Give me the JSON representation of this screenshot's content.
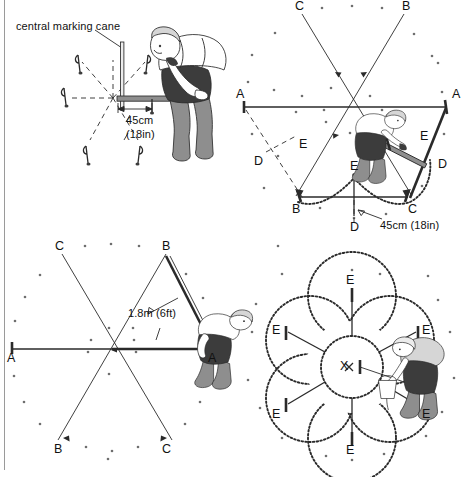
{
  "document": {
    "title": "Marking out a six-bed circular (hexagonal) garden plot",
    "panel_count": 4
  },
  "panels": [
    {
      "id": "panel-1",
      "position": "top-left",
      "name": "setting-the-central-cane",
      "caption": "central marking cane",
      "dimension_metric": "45cm",
      "dimension_imperial": "(18in)",
      "labels": [],
      "figure": {
        "person": "gardener-bending-placing-cane",
        "props": [
          "central-cane",
          "measuring-rod",
          "six-radiating-guide-lines",
          "outer-canes"
        ]
      }
    },
    {
      "id": "panel-2",
      "position": "top-right",
      "name": "marking-the-arc-between-canes",
      "dimension_text": "45cm (18in)",
      "labels": [
        {
          "text": "C",
          "role": "upper-left-cane"
        },
        {
          "text": "B",
          "role": "upper-right-cane"
        },
        {
          "text": "A",
          "role": "left-cane"
        },
        {
          "text": "A",
          "role": "right-cane"
        },
        {
          "text": "E",
          "role": "arc-radius-point-left"
        },
        {
          "text": "D",
          "role": "offset-point-left"
        },
        {
          "text": "E",
          "role": "arc-radius-point-right"
        },
        {
          "text": "D",
          "role": "offset-point-right"
        },
        {
          "text": "B",
          "role": "lower-left-cane"
        },
        {
          "text": "C",
          "role": "lower-right-cane"
        },
        {
          "text": "E",
          "role": "arc-apex"
        },
        {
          "text": "D",
          "role": "arc-centre-below"
        }
      ],
      "figure": {
        "person": "gardener-kneeling-scribing-arc",
        "props": [
          "measuring-rod",
          "string-lines",
          "scribed-arc"
        ]
      }
    },
    {
      "id": "panel-3",
      "position": "bottom-left",
      "name": "measuring-the-triangle-side",
      "dimension_text": "1.8m (6ft)",
      "labels": [
        {
          "text": "C",
          "role": "upper-left-cane"
        },
        {
          "text": "B",
          "role": "upper-right-cane"
        },
        {
          "text": "A",
          "role": "left-cane"
        },
        {
          "text": "A",
          "role": "right-cane"
        },
        {
          "text": "B",
          "role": "lower-left-cane"
        },
        {
          "text": "C",
          "role": "lower-right-cane"
        }
      ],
      "figure": {
        "person": "gardener-bending-holding-line",
        "props": [
          "measuring-line",
          "triangle-guide"
        ]
      }
    },
    {
      "id": "panel-4",
      "position": "bottom-right",
      "name": "finished-six-petal-bed-outline",
      "centre_label": "X",
      "labels": [
        {
          "text": "E",
          "role": "petal-top"
        },
        {
          "text": "E",
          "role": "petal-upper-left"
        },
        {
          "text": "E",
          "role": "petal-upper-right"
        },
        {
          "text": "E",
          "role": "petal-lower-left"
        },
        {
          "text": "E",
          "role": "petal-lower-right"
        },
        {
          "text": "E",
          "role": "petal-bottom"
        },
        {
          "text": "X",
          "role": "centre-point"
        }
      ],
      "figure": {
        "person": "gardener-pouring-sand-marking-outline",
        "props": [
          "sand-bucket",
          "six-petal-dotted-outline",
          "central-circle"
        ]
      }
    }
  ],
  "colors": {
    "ink": "#2a2a2a",
    "paper": "#ffffff",
    "shade_dark": "#3c3c3c",
    "shade_mid": "#8e8e8e",
    "shade_light": "#d6d6d6",
    "texture_dot": "#6e6e6e"
  }
}
